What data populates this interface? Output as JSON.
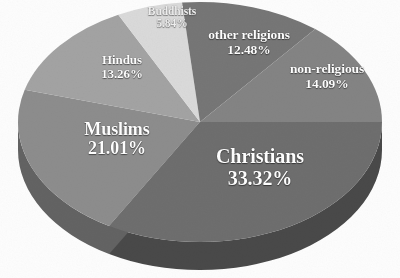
{
  "chart_data": {
    "type": "pie",
    "title": "",
    "subtitle": "",
    "xlabel": "",
    "ylabel": "",
    "legend_position": "none",
    "grid": false,
    "style": "3d-exploded-none-grayscale",
    "value_unit": "percent",
    "total": "100.00%",
    "categories": [
      "Christians",
      "Muslims",
      "non-religious",
      "Hindus",
      "other religions",
      "Buddhists"
    ],
    "values": [
      33.32,
      21.01,
      14.09,
      13.26,
      12.48,
      5.84
    ],
    "slices": [
      {
        "name": "Christians",
        "value": 33.32,
        "label": "Christians",
        "percent_text": "33.32%",
        "color": "#6e6e6e",
        "side_color": "#4a4a4a",
        "start_angle": 0,
        "end_angle": 119.95
      },
      {
        "name": "Muslims",
        "value": 21.01,
        "label": "Muslims",
        "percent_text": "21.01%",
        "color": "#8d8d8d",
        "side_color": "#636363",
        "start_angle": 119.95,
        "end_angle": 195.59
      },
      {
        "name": "Hindus",
        "value": 13.26,
        "label": "Hindus",
        "percent_text": "13.26%",
        "color": "#a3a3a3",
        "side_color": "#777777",
        "start_angle": 195.59,
        "end_angle": 243.33
      },
      {
        "name": "Buddhists",
        "value": 5.84,
        "label": "Buddhists",
        "percent_text": "5.84%",
        "color": "#dadada",
        "side_color": "#a8a8a8",
        "start_angle": 243.33,
        "end_angle": 264.35
      },
      {
        "name": "other religions",
        "value": 12.48,
        "label": "other religions",
        "percent_text": "12.48%",
        "color": "#767676",
        "side_color": "#525252",
        "start_angle": 264.35,
        "end_angle": 309.28
      },
      {
        "name": "non-religious",
        "value": 14.09,
        "label": "non-religious",
        "percent_text": "14.09%",
        "color": "#848484",
        "side_color": "#5c5c5c",
        "start_angle": 309.28,
        "end_angle": 360
      }
    ],
    "geometry": {
      "center_x": 200,
      "center_y": 122,
      "radius_x": 182,
      "radius_y": 120,
      "depth": 28
    },
    "background_color": "#fdfdfd",
    "label_color": "#ffffff"
  }
}
